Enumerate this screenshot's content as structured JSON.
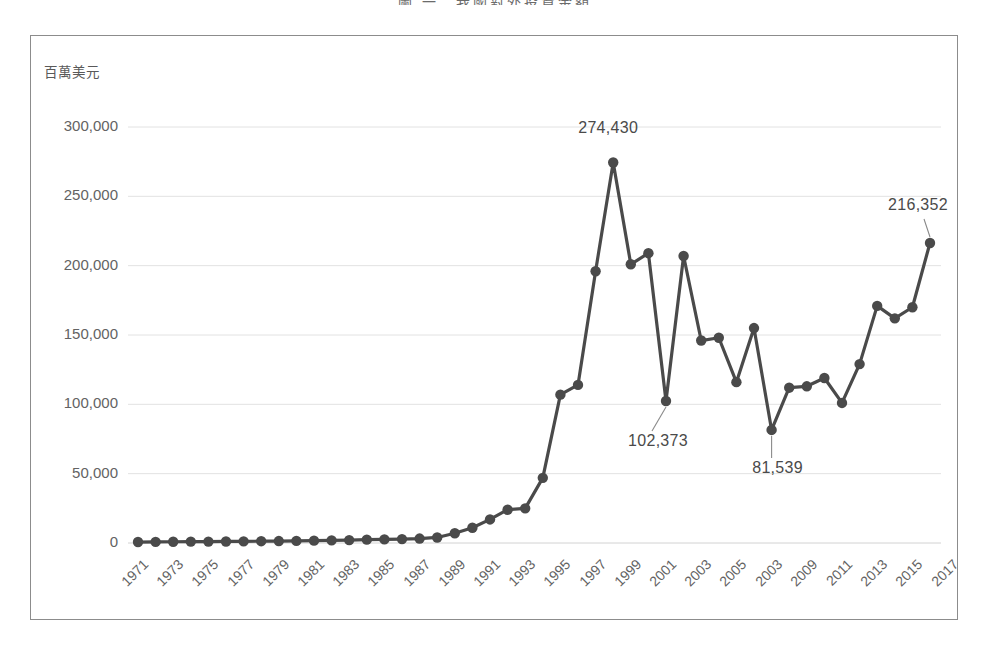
{
  "page": {
    "title": "圖 一　我國對外投資金額"
  },
  "chart_data": {
    "type": "line",
    "title": "圖 一　我國對外投資金額",
    "xlabel": "",
    "ylabel": "百萬美元",
    "ylim": [
      0,
      300000
    ],
    "ytick_step": 50000,
    "ytick_labels": [
      "0",
      "50,000",
      "100,000",
      "150,000",
      "200,000",
      "250,000",
      "300,000"
    ],
    "ytick_values": [
      0,
      50000,
      100000,
      150000,
      200000,
      250000,
      300000
    ],
    "grid": "horizontal",
    "legend": "none",
    "marker": "circle",
    "line_color": "#4a4a4a",
    "marker_color": "#4a4a4a",
    "grid_color": "#e2e2e2",
    "xtick_rotation": -45,
    "xtick_labels": [
      "1971",
      "1973",
      "1975",
      "1977",
      "1979",
      "1981",
      "1983",
      "1985",
      "1987",
      "1989",
      "1991",
      "1993",
      "1995",
      "1997",
      "1999",
      "2001",
      "2003",
      "2005",
      "2003",
      "2009",
      "2011",
      "2013",
      "2015",
      "2017"
    ],
    "x": [
      1971,
      1972,
      1973,
      1974,
      1975,
      1976,
      1977,
      1978,
      1979,
      1980,
      1981,
      1982,
      1983,
      1984,
      1985,
      1986,
      1987,
      1988,
      1989,
      1990,
      1991,
      1992,
      1993,
      1994,
      1995,
      1996,
      1997,
      1998,
      1999,
      2000,
      2001,
      2002,
      2003,
      2004,
      2005,
      2006,
      2007,
      2008,
      2009,
      2010,
      2011,
      2012,
      2013,
      2014,
      2015,
      2016
    ],
    "values": [
      700,
      800,
      900,
      1000,
      1000,
      1100,
      1200,
      1300,
      1400,
      1500,
      1700,
      1900,
      2100,
      2400,
      2600,
      2800,
      3200,
      4000,
      7000,
      11000,
      17000,
      24000,
      25000,
      47000,
      107000,
      114000,
      196000,
      274430,
      201000,
      209000,
      102373,
      207000,
      146000,
      148000,
      116000,
      155000,
      81539,
      112000,
      113000,
      119000,
      101000,
      129000,
      171000,
      162000,
      170000,
      216352
    ],
    "annotations": [
      {
        "label": "274,430",
        "x": 1998,
        "y": 274430
      },
      {
        "label": "102,373",
        "x": 2001,
        "y": 102373
      },
      {
        "label": "81,539",
        "x": 2007,
        "y": 81539
      },
      {
        "label": "216,352",
        "x": 2016,
        "y": 216352
      }
    ]
  }
}
